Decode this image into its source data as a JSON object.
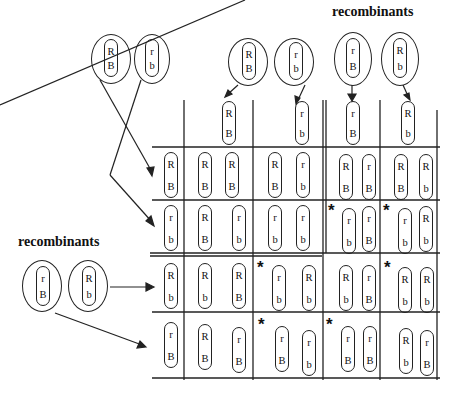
{
  "labels": {
    "top_recombinants": "recombinants",
    "left_recombinants": "recombinants",
    "star": "*"
  },
  "parent_cells_left_top": [
    {
      "a1": "R",
      "a2": "B"
    },
    {
      "a1": "r",
      "a2": "b"
    }
  ],
  "gametes_top": {
    "parental": [
      {
        "a1": "R",
        "a2": "B"
      },
      {
        "a1": "r",
        "a2": "b"
      }
    ],
    "recombinant": [
      {
        "a1": "r",
        "a2": "B"
      },
      {
        "a1": "R",
        "a2": "b"
      }
    ]
  },
  "gametes_left_recombinant_cells": [
    {
      "a1": "r",
      "a2": "B"
    },
    {
      "a1": "R",
      "a2": "b"
    }
  ],
  "columns": [
    {
      "a1": "R",
      "a2": "B"
    },
    {
      "a1": "r",
      "a2": "b"
    },
    {
      "a1": "r",
      "a2": "B"
    },
    {
      "a1": "R",
      "a2": "b"
    }
  ],
  "rows": [
    {
      "a1": "R",
      "a2": "B"
    },
    {
      "a1": "r",
      "a2": "b"
    },
    {
      "a1": "R",
      "a2": "b"
    },
    {
      "a1": "r",
      "a2": "B"
    }
  ],
  "grid": [
    [
      {
        "left": {
          "a1": "R",
          "a2": "B"
        },
        "right": {
          "a1": "R",
          "a2": "B"
        },
        "star": false
      },
      {
        "left": {
          "a1": "R",
          "a2": "B"
        },
        "right": {
          "a1": "r",
          "a2": "b"
        },
        "star": false
      },
      {
        "left": {
          "a1": "R",
          "a2": "B"
        },
        "right": {
          "a1": "r",
          "a2": "B"
        },
        "star": false
      },
      {
        "left": {
          "a1": "R",
          "a2": "B"
        },
        "right": {
          "a1": "R",
          "a2": "b"
        },
        "star": false
      }
    ],
    [
      {
        "left": {
          "a1": "R",
          "a2": "B"
        },
        "right": {
          "a1": "r",
          "a2": "b"
        },
        "star": false
      },
      {
        "left": {
          "a1": "r",
          "a2": "b"
        },
        "right": {
          "a1": "r",
          "a2": "b"
        },
        "star": false
      },
      {
        "left": {
          "a1": "r",
          "a2": "b"
        },
        "right": {
          "a1": "r",
          "a2": "B"
        },
        "star": true
      },
      {
        "left": {
          "a1": "r",
          "a2": "b"
        },
        "right": {
          "a1": "R",
          "a2": "b"
        },
        "star": true
      }
    ],
    [
      {
        "left": {
          "a1": "R",
          "a2": "b"
        },
        "right": {
          "a1": "R",
          "a2": "B"
        },
        "star": false
      },
      {
        "left": {
          "a1": "r",
          "a2": "b"
        },
        "right": {
          "a1": "R",
          "a2": "b"
        },
        "star": true
      },
      {
        "left": {
          "a1": "R",
          "a2": "b"
        },
        "right": {
          "a1": "r",
          "a2": "B"
        },
        "star": false
      },
      {
        "left": {
          "a1": "R",
          "a2": "b"
        },
        "right": {
          "a1": "R",
          "a2": "b"
        },
        "star": true
      }
    ],
    [
      {
        "left": {
          "a1": "R",
          "a2": "B"
        },
        "right": {
          "a1": "r",
          "a2": "B"
        },
        "star": false
      },
      {
        "left": {
          "a1": "r",
          "a2": "B"
        },
        "right": {
          "a1": "r",
          "a2": "b"
        },
        "star": true
      },
      {
        "left": {
          "a1": "r",
          "a2": "B"
        },
        "right": {
          "a1": "r",
          "a2": "B"
        },
        "star": true
      },
      {
        "left": {
          "a1": "R",
          "a2": "b"
        },
        "right": {
          "a1": "r",
          "a2": "B"
        },
        "star": false
      }
    ]
  ]
}
